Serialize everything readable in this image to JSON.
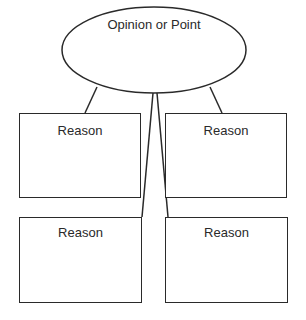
{
  "diagram": {
    "center_node": {
      "label": "Opinion or Point",
      "shape": "ellipse"
    },
    "reasons": [
      {
        "label": "Reason",
        "position": "top-left"
      },
      {
        "label": "Reason",
        "position": "top-right"
      },
      {
        "label": "Reason",
        "position": "bottom-left"
      },
      {
        "label": "Reason",
        "position": "bottom-right"
      }
    ],
    "stroke_color": "#2a2a2a",
    "background_color": "#ffffff"
  }
}
